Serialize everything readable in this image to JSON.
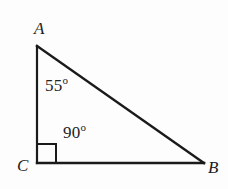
{
  "figure": {
    "background_color": "#fdfdfd",
    "stroke_color": "#1a1a1a",
    "stroke_width": 2.2,
    "vertices": [
      {
        "name": "A",
        "label": "A",
        "x": 37,
        "y": 46
      },
      {
        "name": "B",
        "label": "B",
        "x": 204,
        "y": 163
      },
      {
        "name": "C",
        "label": "C",
        "x": 37,
        "y": 163
      }
    ],
    "edges": [
      {
        "name": "leg-AC",
        "from": "A",
        "to": "C"
      },
      {
        "name": "leg-CB",
        "from": "C",
        "to": "B"
      },
      {
        "name": "hypotenuse-AB",
        "from": "A",
        "to": "B"
      }
    ],
    "angle_labels": [
      {
        "name": "angle-at-A",
        "value": "55",
        "unit": "o",
        "at_vertex": "A"
      },
      {
        "name": "angle-at-C",
        "value": "90",
        "unit": "o",
        "at_vertex": "C"
      }
    ],
    "right_angle_marker": {
      "name": "right-angle-marker",
      "at_vertex": "C",
      "size": 18
    }
  }
}
